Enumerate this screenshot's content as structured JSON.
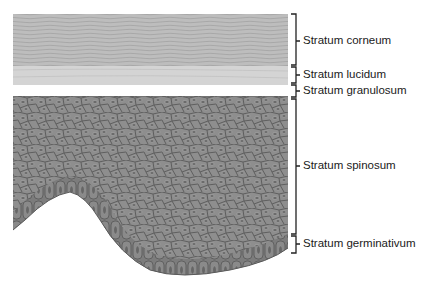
{
  "diagram": {
    "layers": [
      {
        "id": "corneum",
        "label": "Stratum corneum",
        "top": 14,
        "bottom": 65,
        "label_y": 41
      },
      {
        "id": "lucidum",
        "label": "Stratum lucidum",
        "top": 67,
        "bottom": 83,
        "label_y": 75
      },
      {
        "id": "granulosum",
        "label": "Stratum granulosum",
        "top": 85,
        "bottom": 97,
        "label_y": 91
      },
      {
        "id": "spinosum",
        "label": "Stratum spinosum",
        "top": 99,
        "bottom": 234,
        "label_y": 166
      },
      {
        "id": "germinativum",
        "label": "Stratum germinativum",
        "top": 236,
        "bottom": 253,
        "label_y": 244
      }
    ],
    "colors": {
      "corneum": "#bdbdbd",
      "corneum_lines": "#9e9e9e",
      "lucidum": "#d6d6d6",
      "granulosum": "#7a7a7a",
      "cells": "#8e8e8e",
      "cell_border": "#5e5e5e",
      "nucleus": "#6e6e6e",
      "bracket": "#222222"
    }
  }
}
